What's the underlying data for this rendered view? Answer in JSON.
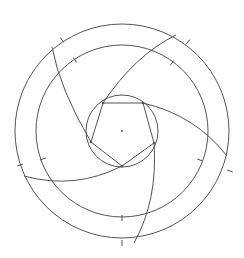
{
  "figure": {
    "colors": {
      "stroke": "#555555",
      "background": "#ffffff"
    },
    "center": [
      122,
      131
    ],
    "circles": [
      {
        "name": "outer-circle",
        "r": 107
      },
      {
        "name": "middle-circle",
        "r": 86
      },
      {
        "name": "inner-circle",
        "r": 36
      }
    ],
    "pentagon": [
      [
        103,
        103
      ],
      [
        143,
        103
      ],
      [
        154,
        143
      ],
      [
        122,
        166
      ],
      [
        91,
        142
      ]
    ],
    "arcs": [
      {
        "from": [
          91,
          142
        ],
        "to": [
          52,
          47
        ],
        "ctrl": [
          60,
          90
        ]
      },
      {
        "from": [
          103,
          103
        ],
        "to": [
          176,
          35
        ],
        "ctrl": [
          135,
          55
        ]
      },
      {
        "from": [
          143,
          103
        ],
        "to": [
          227,
          156
        ],
        "ctrl": [
          195,
          115
        ]
      },
      {
        "from": [
          154,
          143
        ],
        "to": [
          134,
          243
        ],
        "ctrl": [
          158,
          200
        ]
      },
      {
        "from": [
          122,
          166
        ],
        "to": [
          24,
          176
        ],
        "ctrl": [
          75,
          190
        ]
      }
    ],
    "ticks": [
      [
        62,
        40
      ],
      [
        75,
        60
      ],
      [
        188,
        42
      ],
      [
        172,
        63
      ],
      [
        20,
        165
      ],
      [
        43,
        159
      ],
      [
        230,
        171
      ],
      [
        200,
        160
      ],
      [
        122,
        243
      ],
      [
        122,
        218
      ]
    ]
  }
}
